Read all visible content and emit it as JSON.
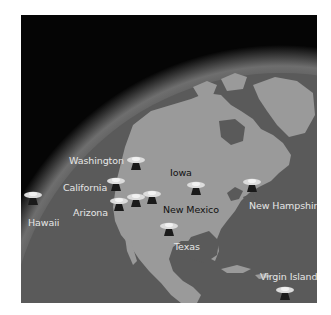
{
  "image": {
    "description": "Globe view of North America with satellite ground station sites",
    "colors": {
      "space": "#050505",
      "ocean": "#5a5a5a",
      "land": "#9a9a9a",
      "atmosphere_glow": "#7a7a7a",
      "label_light": "#e6e6e6",
      "label_dark": "#111111"
    }
  },
  "sites": [
    {
      "name": "Washington",
      "label_color": "light"
    },
    {
      "name": "California",
      "label_color": "light"
    },
    {
      "name": "Arizona",
      "label_color": "light"
    },
    {
      "name": "Hawaii",
      "label_color": "light"
    },
    {
      "name": "Iowa",
      "label_color": "dark"
    },
    {
      "name": "New Mexico",
      "label_color": "dark"
    },
    {
      "name": "Texas",
      "label_color": "light"
    },
    {
      "name": "New Hampshire",
      "label_color": "light"
    },
    {
      "name": "Virgin Islands",
      "label_color": "light"
    }
  ],
  "icon": "satellite-dish-icon"
}
